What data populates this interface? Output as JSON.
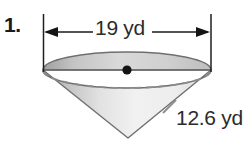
{
  "figure": {
    "problem_number": "1.",
    "shape": "cone",
    "orientation": "apex-down",
    "diameter_label": "19 yd",
    "slant_height_label": "12.6 yd",
    "center_point_marker": "center-dot",
    "colors": {
      "outline": "#6b6b6b",
      "cap_fill_light": "#e0e0e0",
      "cap_fill_dark": "#a9a9a9",
      "body_fill_light": "#f4f4f4",
      "body_fill_dark": "#a6a6a6",
      "dashed_arc": "#8a8a8a",
      "dimension_line": "#1a1a1a",
      "text": "#2b2b2b",
      "background": "#ffffff"
    }
  }
}
